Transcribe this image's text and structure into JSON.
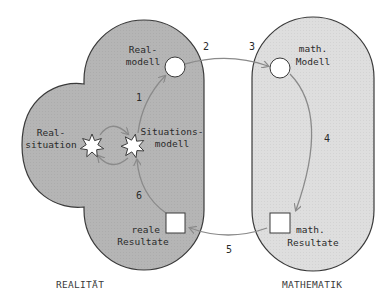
{
  "regions": {
    "reality": {
      "label": "REALITÄT",
      "fill": "#b5b5b5"
    },
    "mathematics": {
      "label": "MATHEMATIK",
      "fill": "#dedede"
    }
  },
  "nodes": {
    "real_situation": {
      "line1": "Real-",
      "line2": "situation",
      "shape": "star"
    },
    "situation_model": {
      "line1": "Situations-",
      "line2": "modell",
      "shape": "star"
    },
    "real_model": {
      "line1": "Real-",
      "line2": "modell",
      "shape": "circle"
    },
    "math_model": {
      "line1": "math.",
      "line2": "Modell",
      "shape": "circle"
    },
    "math_results": {
      "line1": "math.",
      "line2": "Resultate",
      "shape": "square"
    },
    "real_results": {
      "line1": "reale",
      "line2": "Resultate",
      "shape": "square"
    }
  },
  "steps": [
    {
      "id": "1",
      "label": "1"
    },
    {
      "id": "2",
      "label": "2"
    },
    {
      "id": "3",
      "label": "3"
    },
    {
      "id": "4",
      "label": "4"
    },
    {
      "id": "5",
      "label": "5"
    },
    {
      "id": "6",
      "label": "6"
    }
  ],
  "colors": {
    "arrow": "#8a8a8a",
    "outline": "#3a3a3a",
    "node_fill": "#ffffff"
  }
}
